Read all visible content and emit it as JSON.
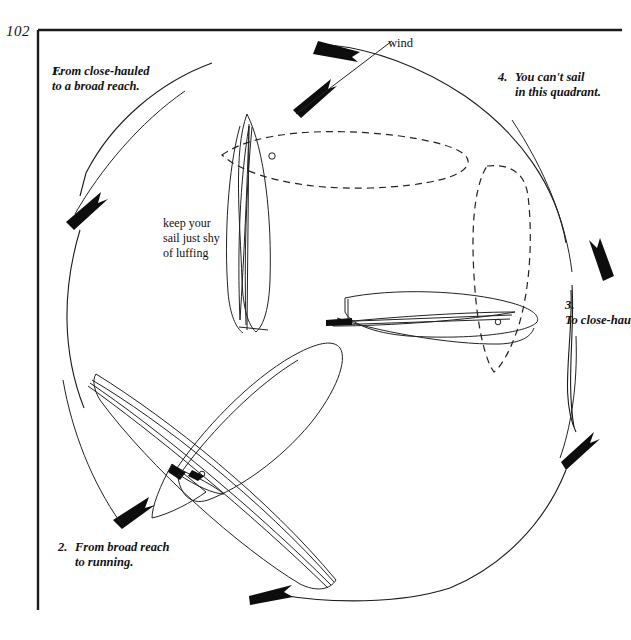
{
  "page": {
    "number": "102",
    "border_color": "#1a1a1a",
    "ink_color": "#111111"
  },
  "wind": {
    "label": "wind"
  },
  "captions": [
    {
      "index": "1.",
      "line1": "From close-hauled",
      "line2": "to a broad reach."
    },
    {
      "index": "2.",
      "line1": "From broad reach",
      "line2": "to running."
    },
    {
      "index": "3.",
      "line1": "To close-hau",
      "line2": ""
    },
    {
      "index": "4.",
      "line1": "You can't sail",
      "line2": "in this quadrant."
    }
  ],
  "annotation": {
    "line1": "keep your",
    "line2": "sail just shy",
    "line3": "of luffing"
  },
  "diagram": {
    "type": "points-of-sail",
    "boats": [
      {
        "name": "boat-close-hauled",
        "position": "top-center",
        "heading": "north",
        "sail": "trimmed-tight",
        "ghost_sail": "dashed-horizontal-right"
      },
      {
        "name": "boat-running",
        "position": "right-center",
        "heading": "east",
        "sail": "eased-full",
        "ghost_sail": "dashed-vertical"
      },
      {
        "name": "boat-broad-reach",
        "position": "lower-left",
        "heading": "southwest",
        "sail": "eased-wide",
        "ghost_sail": "none"
      }
    ],
    "arrow_count": 5,
    "circle_direction": "clockwise"
  }
}
